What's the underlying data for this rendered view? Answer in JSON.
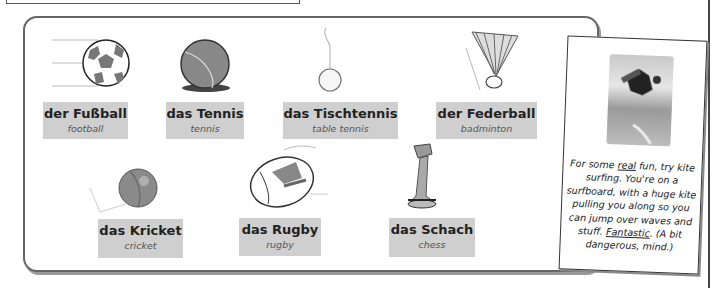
{
  "vocab_panel": {
    "items": [
      {
        "german": "der Fußball",
        "english": "football",
        "icon": "football-icon"
      },
      {
        "german": "das Tennis",
        "english": "tennis",
        "icon": "tennis-ball-icon"
      },
      {
        "german": "das Tischtennis",
        "english": "table tennis",
        "icon": "ping-pong-ball-icon"
      },
      {
        "german": "der Federball",
        "english": "badminton",
        "icon": "shuttlecock-icon"
      },
      {
        "german": "das Kricket",
        "english": "cricket",
        "icon": "cricket-ball-icon"
      },
      {
        "german": "das Rugby",
        "english": "rugby",
        "icon": "rugby-ball-icon"
      },
      {
        "german": "das Schach",
        "english": "chess",
        "icon": "chess-piece-icon"
      }
    ]
  },
  "note_card": {
    "photo": "kite-surfer-photo",
    "text_1": "For some ",
    "emph_1": "real",
    "text_2": " fun, try kite surfing.  You're on a surfboard, with a huge kite pulling you along so you can jump over waves and stuff. ",
    "emph_2": "Fantastic",
    "text_3": ". (A bit dangerous, mind.)"
  }
}
